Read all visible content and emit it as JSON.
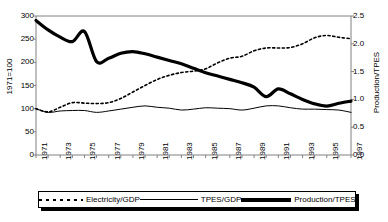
{
  "chart_data": {
    "type": "line",
    "title": "",
    "xlabel": "",
    "ylabel": "1971=100",
    "y2label": "Production/TPES",
    "xlim": [
      1971,
      1997
    ],
    "ylim": [
      0,
      300
    ],
    "y2lim": [
      0.0,
      2.5
    ],
    "grid": false,
    "legend_position": "bottom",
    "x": [
      1971,
      1972,
      1973,
      1974,
      1975,
      1976,
      1977,
      1978,
      1979,
      1980,
      1981,
      1982,
      1983,
      1984,
      1985,
      1986,
      1987,
      1988,
      1989,
      1990,
      1991,
      1992,
      1993,
      1994,
      1995,
      1996,
      1997
    ],
    "yticks": [
      0,
      50,
      100,
      150,
      200,
      250,
      300
    ],
    "ytick_labels": [
      "0",
      "50",
      "100",
      "150",
      "200",
      "250",
      "300"
    ],
    "y2ticks": [
      0.0,
      0.5,
      1.0,
      1.5,
      2.0,
      2.5
    ],
    "y2tick_labels": [
      "0.0",
      "0.5",
      "1.0",
      "1.5",
      "2.0",
      "2.5"
    ],
    "xtick_labels": [
      "1971",
      "1973",
      "1975",
      "1977",
      "1979",
      "1981",
      "1983",
      "1985",
      "1987",
      "1989",
      "1991",
      "1993",
      "1995",
      "1997"
    ],
    "series": [
      {
        "name": "Electricity/GDP",
        "axis": "left",
        "style": "dotted",
        "values": [
          100,
          93,
          103,
          113,
          112,
          111,
          113,
          122,
          136,
          150,
          163,
          172,
          178,
          181,
          186,
          199,
          209,
          213,
          225,
          231,
          231,
          232,
          240,
          253,
          258,
          254,
          251
        ]
      },
      {
        "name": "TPES/GDP",
        "axis": "left",
        "style": "thin-solid",
        "values": [
          100,
          92,
          95,
          96,
          96,
          92,
          95,
          99,
          103,
          106,
          103,
          101,
          97,
          99,
          102,
          101,
          100,
          97,
          101,
          106,
          106,
          102,
          99,
          99,
          98,
          97,
          92
        ]
      },
      {
        "name": "Production/TPES",
        "axis": "right",
        "style": "thick-solid",
        "values": [
          2.42,
          2.25,
          2.12,
          2.04,
          2.22,
          1.68,
          1.74,
          1.83,
          1.86,
          1.82,
          1.76,
          1.7,
          1.64,
          1.56,
          1.48,
          1.42,
          1.36,
          1.3,
          1.22,
          1.05,
          1.19,
          1.1,
          1.0,
          0.92,
          0.88,
          0.93,
          0.97
        ]
      }
    ]
  },
  "legend": {
    "items": [
      {
        "label": "Electricity/GDP",
        "style": "dotted"
      },
      {
        "label": "TPES/GDP",
        "style": "thin-solid"
      },
      {
        "label": "Production/TPES",
        "style": "thick-solid"
      }
    ]
  },
  "colors": {
    "line": "#000000",
    "background": "#ffffff",
    "axis": "#808080"
  }
}
